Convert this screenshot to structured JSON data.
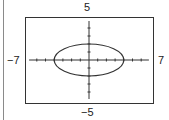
{
  "chart_data": {
    "type": "line",
    "title": "",
    "xlabel": "",
    "ylabel": "",
    "xlim": [
      -7,
      7
    ],
    "ylim": [
      -5,
      5
    ],
    "grid": false,
    "equation": "x^2/16 + y^2/4 = 1",
    "series": [
      {
        "name": "ellipse",
        "shape": "ellipse",
        "center": [
          0,
          0
        ],
        "semi_axis_x": 4,
        "semi_axis_y": 2,
        "points": [
          [
            -4,
            0
          ],
          [
            0,
            2
          ],
          [
            4,
            0
          ],
          [
            0,
            -2
          ]
        ]
      }
    ],
    "x_ticks_step": 1,
    "y_ticks_step": 1
  },
  "labels": {
    "ymax": "5",
    "ymin": "−5",
    "xmin": "−7",
    "xmax": "7"
  },
  "colors": {
    "curve": "#333333",
    "axes": "#333333",
    "frame": "#333333"
  }
}
